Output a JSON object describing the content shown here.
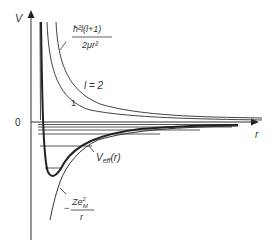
{
  "diagram": {
    "axes": {
      "y_label": "V",
      "x_label": "r",
      "origin_label": "0"
    },
    "labels": {
      "centrifugal_num": "ħ²l(l+1)",
      "centrifugal_den": "2μr²",
      "l2": "l = 2",
      "l1": "1",
      "veff_main": "V",
      "veff_sub": "eff",
      "veff_arg": "(r)",
      "coulomb_minus": "−",
      "coulomb_num_main": "Ze",
      "coulomb_num_sup": "2",
      "coulomb_num_sub": "M",
      "coulomb_den": "r"
    },
    "colors": {
      "curve": "#222222",
      "thin_curve": "#555555",
      "levels": "#444444",
      "axis": "#333333"
    }
  }
}
